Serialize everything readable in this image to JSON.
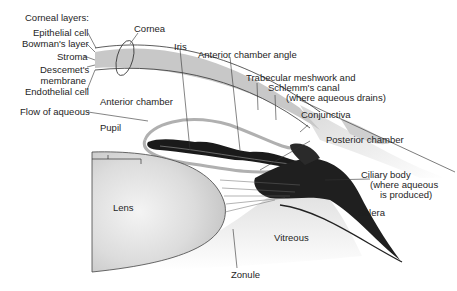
{
  "diagram": {
    "labels": {
      "corneal_layers_heading": "Corneal layers:",
      "epithelial_cell": "Epithelial cell",
      "bowmans_layer": "Bowman's layer",
      "stroma": "Stroma",
      "descemets_1": "Descemet's",
      "descemets_2": "membrane",
      "endothelial_cell": "Endothelial cell",
      "cornea": "Cornea",
      "iris": "Iris",
      "anterior_chamber_angle": "Anterior chamber angle",
      "trabecular_1": "Trabecular meshwork and",
      "trabecular_2": "Schlemm's canal",
      "trabecular_3": "(where aqueous drains)",
      "conjunctiva": "Conjunctiva",
      "anterior_chamber": "Anterior chamber",
      "flow_of_aqueous": "Flow of aqueous",
      "pupil": "Pupil",
      "posterior_chamber": "Posterior chamber",
      "ciliary_1": "Ciliary body",
      "ciliary_2": "(where aqueous",
      "ciliary_3": "is produced)",
      "lens": "Lens",
      "sclera": "Sclera",
      "vitreous": "Vitreous",
      "zonule": "Zonule"
    },
    "colors": {
      "stroma_band": "#c8c8c8",
      "tissue_dark": "#1a1a1a",
      "lens_fill": "#d9d9d9",
      "aqueous_flow": "#b0b0b0",
      "leader": "#333333"
    }
  }
}
